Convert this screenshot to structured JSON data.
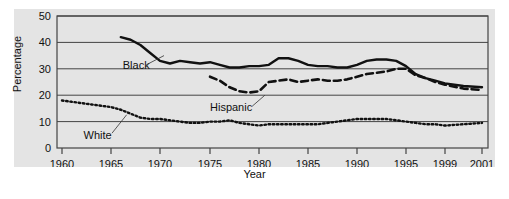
{
  "chart_data": {
    "type": "line",
    "title": "",
    "xlabel": "Year",
    "ylabel": "Percentage",
    "xlim": [
      1960,
      2001
    ],
    "ylim": [
      0,
      50
    ],
    "yticks": [
      0,
      10,
      20,
      30,
      40,
      50
    ],
    "ytick_labels": [
      "0",
      "10",
      "20",
      "30",
      "40",
      "50"
    ],
    "xticks": [
      1960,
      1965,
      1970,
      1975,
      1980,
      1985,
      1990,
      1995,
      1999,
      2001
    ],
    "xtick_labels": [
      "1960",
      "1965",
      "1970",
      "1975",
      "1980",
      "1985",
      "1990",
      "1995",
      "1999",
      "2001"
    ],
    "grid": "horizontal",
    "legend_position": "inline-annotations",
    "plot_background": "#e4e4e4",
    "series": [
      {
        "name": "Black",
        "style": "solid",
        "color": "#111111",
        "label_x": 1966.2,
        "label_y": 31.5,
        "x": [
          1966,
          1967,
          1968,
          1969,
          1970,
          1971,
          1972,
          1973,
          1974,
          1975,
          1976,
          1977,
          1978,
          1979,
          1980,
          1981,
          1982,
          1983,
          1984,
          1985,
          1986,
          1987,
          1988,
          1989,
          1990,
          1991,
          1992,
          1993,
          1994,
          1995,
          1996,
          1997,
          1998,
          1999,
          2000,
          2001
        ],
        "y": [
          42,
          41,
          39,
          36,
          33,
          32,
          33,
          32.5,
          32,
          32.5,
          31.5,
          30.5,
          30.5,
          31,
          31,
          31.5,
          34,
          34,
          33,
          31.5,
          31,
          31,
          30.5,
          30.5,
          31.5,
          33,
          33.5,
          33.5,
          33,
          31,
          28,
          26.5,
          25.5,
          24.5,
          23.5,
          23
        ]
      },
      {
        "name": "Hispanic",
        "style": "dashed",
        "color": "#111111",
        "label_x": 1975.0,
        "label_y": 15.5,
        "x": [
          1975,
          1976,
          1977,
          1978,
          1979,
          1980,
          1981,
          1982,
          1983,
          1984,
          1985,
          1986,
          1987,
          1988,
          1989,
          1990,
          1991,
          1992,
          1993,
          1994,
          1995,
          1996,
          1997,
          1998,
          1999,
          2000,
          2001
        ],
        "y": [
          27,
          25.5,
          23,
          21.5,
          21,
          21.5,
          25,
          25.5,
          26,
          25,
          25.5,
          26,
          25.5,
          25.5,
          26,
          27,
          28,
          28.5,
          29,
          30,
          30,
          27.5,
          26.5,
          25,
          24,
          22.5,
          22
        ]
      },
      {
        "name": "White",
        "style": "dotted",
        "color": "#111111",
        "label_x": 1962.2,
        "label_y": 5.0,
        "x": [
          1960,
          1961,
          1962,
          1963,
          1964,
          1965,
          1966,
          1967,
          1968,
          1969,
          1970,
          1971,
          1972,
          1973,
          1974,
          1975,
          1976,
          1977,
          1978,
          1979,
          1980,
          1981,
          1982,
          1983,
          1984,
          1985,
          1986,
          1987,
          1988,
          1989,
          1990,
          1991,
          1992,
          1993,
          1994,
          1995,
          1996,
          1997,
          1998,
          1999,
          2000,
          2001
        ],
        "y": [
          18,
          17.5,
          17,
          16.5,
          16,
          15.5,
          14.5,
          13,
          11.5,
          11,
          11,
          10.5,
          10,
          9.5,
          9.5,
          10,
          10,
          10.5,
          9.5,
          9,
          8.5,
          9,
          9,
          9,
          9,
          9,
          9,
          9.5,
          10,
          10.5,
          11,
          11,
          11,
          11,
          10.5,
          10,
          9.5,
          9,
          9,
          8.5,
          9,
          9.5
        ]
      }
    ]
  }
}
